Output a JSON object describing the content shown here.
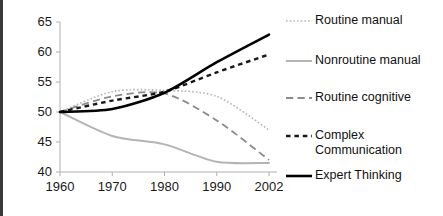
{
  "chart_data": {
    "type": "line",
    "title": "",
    "subtitle": "",
    "xlabel": "",
    "ylabel": "",
    "x": [
      1960,
      1970,
      1980,
      1990,
      2002
    ],
    "xtick_labels": [
      "1960",
      "1970",
      "1980",
      "1990",
      "2002"
    ],
    "ytick_labels": [
      "40",
      "45",
      "50",
      "55",
      "60",
      "65"
    ],
    "yticks": [
      40,
      45,
      50,
      55,
      60,
      65
    ],
    "ylim": [
      40,
      65
    ],
    "xlim": [
      1960,
      2002
    ],
    "grid": false,
    "legend_position": "right",
    "series": [
      {
        "name": "Routine manual",
        "color": "#b4b4b4",
        "style": "dotted",
        "width": 1.6,
        "values": [
          50.0,
          53.4,
          53.6,
          52.6,
          47.0
        ]
      },
      {
        "name": "Nonroutine manual",
        "color": "#b4b4b4",
        "style": "solid",
        "width": 2.0,
        "values": [
          50.0,
          46.0,
          44.6,
          41.7,
          41.5
        ]
      },
      {
        "name": "Routine cognitive",
        "color": "#8c8c8c",
        "style": "dashed",
        "width": 1.8,
        "values": [
          50.0,
          52.6,
          53.1,
          48.6,
          42.0
        ]
      },
      {
        "name": "Complex Communication",
        "color": "#1a1a1a",
        "style": "short-dashed",
        "width": 2.4,
        "values": [
          50.0,
          51.9,
          53.4,
          56.6,
          59.6
        ]
      },
      {
        "name": "Expert Thinking",
        "color": "#000000",
        "style": "solid",
        "width": 2.6,
        "values": [
          50.0,
          50.5,
          53.2,
          58.3,
          62.9
        ]
      }
    ]
  },
  "legend": {
    "items": [
      {
        "label": "Routine manual"
      },
      {
        "label": "Nonroutine manual"
      },
      {
        "label": "Routine cognitive"
      },
      {
        "label": "Complex\nCommunication"
      },
      {
        "label": "Expert Thinking"
      }
    ]
  },
  "axes": {
    "axis_color": "#b0b0b0",
    "tick_color": "#b0b0b0"
  }
}
